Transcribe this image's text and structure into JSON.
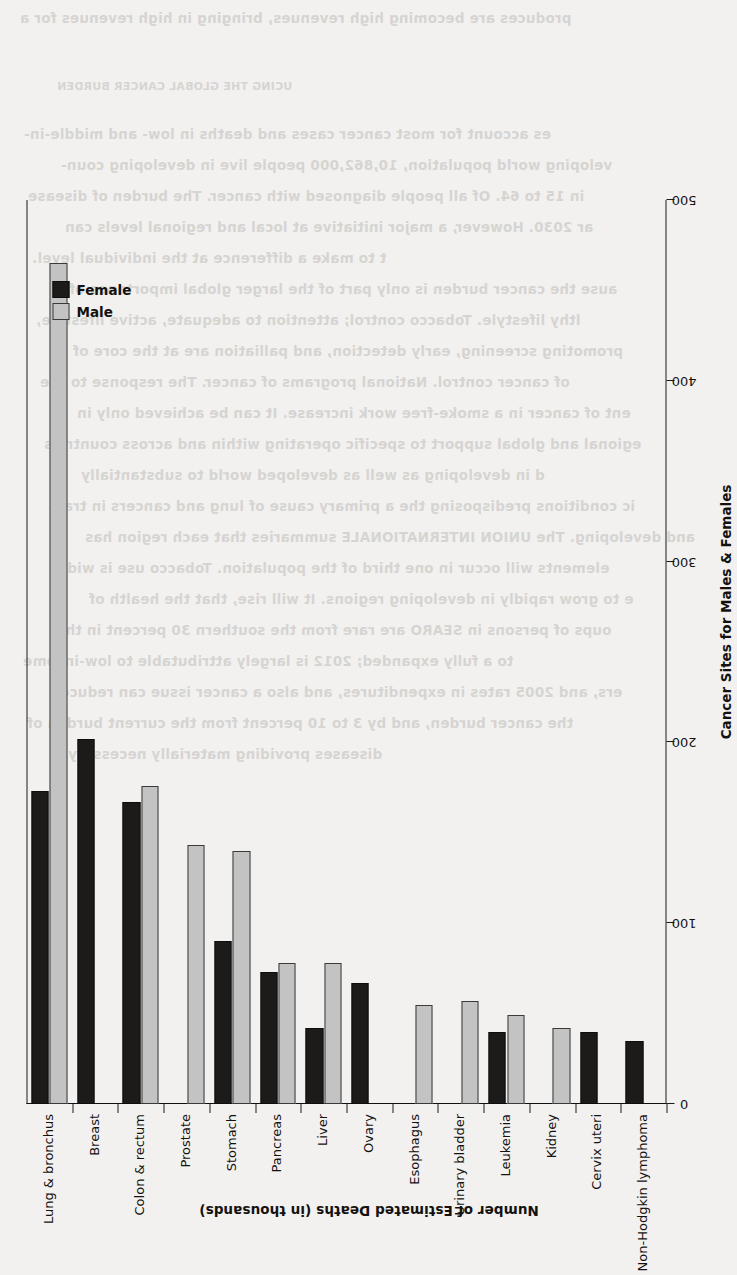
{
  "page": {
    "background_color": "#f2f1ef",
    "rotation_degrees": -90,
    "bleed_through_lines": [
      "produces are becoming high revenues, bringing in high revenues for a",
      "UCING THE GLOBAL CANCER BURDEN",
      "es account for most cancer cases and deaths in low- and middle-in-",
      "veloping world population, 10,862,000 people live in developing coun-",
      "in 15 to 64. Of all people diagnosed with cancer. The burden of disease",
      "ar 2030. However, a major initiative at local and regional levels can",
      "t to make a difference at the individual level.",
      "ause the cancer burden is only part of the larger global importance of",
      "lthy lifestyle. Tobacco control; attention to adequate, active lifestyle,",
      "promoting screening, early detection, and palliation are at the core of",
      "of cancer control. National programs of cancer. The response to the",
      "ent of cancer in a smoke-free work increase. It can be achieved only in",
      "egional and global support to specific operating within and across countries",
      "d in developing as well as developed world to substantially",
      "ic conditions predisposing the a primary cause of lung and cancers in tran-",
      "and developing. The UNION INTERNATIONALE summaries that each region has",
      "elements will occur in one third of the population. Tobacco use is wide-",
      "e to grow rapidly in developing regions. It will rise, that the health of",
      "oups of persons in SEARO are rare from the southern 30 percent in the",
      "to a fully expanded; 2012 is largely attributable to low-income",
      "ers, and 2005 rates in expenditures, and also a cancer issue can reduce",
      "the cancer burden, and by 3 to 10 percent from the current burden of",
      "diseases providing materially necessary."
    ]
  },
  "chart_data": {
    "type": "bar",
    "orientation": "vertical-rotated",
    "title": "",
    "xlabel": "Cancer Sites for Males & Females",
    "ylabel": "Number of Estimated Deaths (in thousands)",
    "ylim": [
      0,
      500
    ],
    "yticks": [
      0,
      100,
      200,
      300,
      400,
      500
    ],
    "ytick_labels": [
      "0",
      "100",
      "200",
      "300",
      "400",
      "500"
    ],
    "grid": true,
    "legend_position": "top-left",
    "categories": [
      "Lung & bronchus",
      "Breast",
      "Colon & rectum",
      "Prostate",
      "Stomach",
      "Pancreas",
      "Liver",
      "Ovary",
      "Esophagus",
      "Urinary bladder",
      "Leukemia",
      "Kidney",
      "Cervix uteri",
      "Non-Hodgkin lymphoma"
    ],
    "series": [
      {
        "name": "Female",
        "color": "#1c1b1a",
        "values": [
          173,
          202,
          167,
          0,
          90,
          73,
          42,
          67,
          0,
          0,
          40,
          0,
          40,
          35
        ]
      },
      {
        "name": "Male",
        "color": "#c3c3c3",
        "values": [
          465,
          0,
          176,
          143,
          140,
          78,
          78,
          0,
          55,
          57,
          49,
          42,
          0,
          0
        ]
      }
    ]
  }
}
